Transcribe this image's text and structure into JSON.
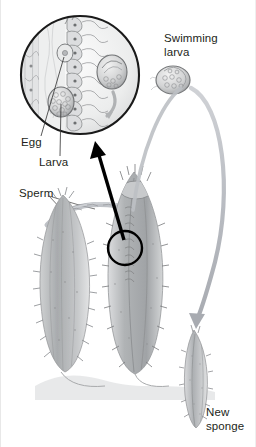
{
  "figure": {
    "background_color": "#ffffff",
    "width": 256,
    "height": 447
  },
  "labels": {
    "egg": "Egg",
    "larva": "Larva",
    "sperm": "Sperm",
    "swimming_larva": "Swimming\nlarva",
    "new_sponge": "New\nsponge"
  },
  "colors": {
    "text": "#231f20",
    "inset_outline": "#1a1a1a",
    "pointer_arrow": "#000000",
    "flow_arrow": "#b9bcc2",
    "sperm_stream": "#a9adb4",
    "sponge_body": "#b6b8ba",
    "sponge_shade": "#8e9194",
    "leader_line": "#3a3a3a"
  },
  "diagram_elements": {
    "inset_circle": {
      "name": "magnified-tissue-inset",
      "center_x": 79,
      "center_y": 75,
      "radius": 60,
      "contents": [
        "choanocyte-cells",
        "egg-cell",
        "larva-cluster",
        "embryo",
        "sperm-flagella"
      ]
    },
    "callout_circle": {
      "name": "callout-focus-circle",
      "center_x": 124,
      "center_y": 248,
      "radius": 17
    },
    "pointer_arrow": {
      "name": "inset-pointer-arrow",
      "from_x": 124,
      "from_y": 243,
      "to_x": 94,
      "to_y": 145
    },
    "flow_arrow": {
      "name": "larva-to-new-sponge-arrow",
      "from_x": 187,
      "from_y": 85,
      "to_x": 196,
      "to_y": 323
    },
    "sponges": [
      {
        "name": "parent-sponge-left",
        "x": 62,
        "y": 280
      },
      {
        "name": "parent-sponge-right",
        "x": 132,
        "y": 265
      },
      {
        "name": "new-sponge",
        "x": 193,
        "y": 370
      }
    ],
    "swimming_larva": {
      "name": "swimming-larva-body",
      "x": 172,
      "y": 80
    }
  }
}
